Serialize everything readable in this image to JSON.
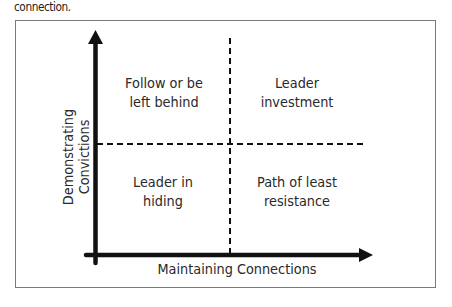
{
  "caption": "connection.",
  "diagram": {
    "type": "2x2 matrix",
    "x_axis_label": "Maintaining Connections",
    "y_axis_label": "Demonstrating Convictions",
    "quadrants": {
      "top_left": {
        "line1": "Follow or be",
        "line2": "left behind"
      },
      "top_right": {
        "line1": "Leader",
        "line2": "investment"
      },
      "bottom_left": {
        "line1": "Leader in",
        "line2": "hiding"
      },
      "bottom_right": {
        "line1": "Path of least",
        "line2": "resistance"
      }
    },
    "colors": {
      "axis": "#111111",
      "frame": "#7a7a7a",
      "text": "#2a2a2a"
    }
  }
}
